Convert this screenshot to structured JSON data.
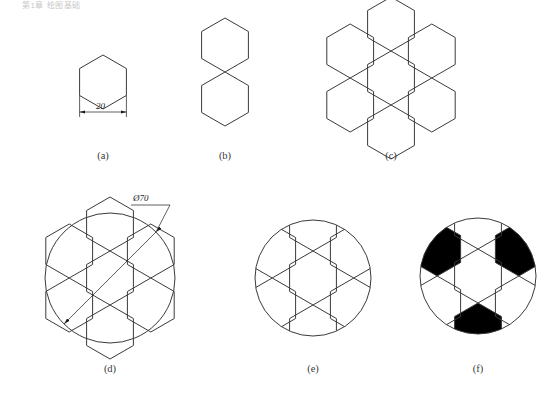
{
  "header": {
    "text": "第1章 绘图基础"
  },
  "figure": {
    "line_color": "#3a3a3a",
    "fill_black": "#000000",
    "background": "#ffffff"
  },
  "panels": [
    {
      "id": "a",
      "caption": "(a)",
      "caption_x": 83,
      "caption_y": 150,
      "description": "single flat-top hexagon with side dimension",
      "center_x": 103,
      "center_y": 82,
      "radius": 27,
      "dimension": {
        "label": "20",
        "value": 20,
        "x": 104,
        "y": 106,
        "edge": "bottom"
      }
    },
    {
      "id": "b",
      "caption": "(b)",
      "caption_x": 205,
      "caption_y": 150,
      "description": "two hexagons stacked sharing one edge",
      "center_x": 225,
      "center_y": 72,
      "radius": 27
    },
    {
      "id": "c",
      "caption": "(c)",
      "caption_x": 371,
      "caption_y": 150,
      "description": "seven hexagon honeycomb rosette",
      "center_x": 391,
      "center_y": 78,
      "radius": 27
    },
    {
      "id": "d",
      "caption": "(d)",
      "caption_x": 99,
      "caption_y": 363,
      "description": "honeycomb rosette with circle overlay and diameter dimension",
      "center_x": 110,
      "center_y": 278,
      "radius": 27,
      "circle_radius": 65,
      "dimension": {
        "label": "Ø70",
        "value": 70,
        "x": 131,
        "y": 192
      }
    },
    {
      "id": "e",
      "caption": "(e)",
      "caption_x": 293,
      "caption_y": 363,
      "description": "pattern trimmed to circle, soccer ball outline",
      "center_x": 313,
      "center_y": 278,
      "radius": 27,
      "circle_radius": 58
    },
    {
      "id": "f",
      "caption": "(f)",
      "caption_x": 478,
      "caption_y": 363,
      "description": "finished soccer ball with black filled patches",
      "center_x": 478,
      "center_y": 276,
      "radius": 27,
      "circle_radius": 58,
      "black_patch_count": 3,
      "black_patches": [
        "upper-right",
        "left",
        "bottom"
      ]
    }
  ]
}
